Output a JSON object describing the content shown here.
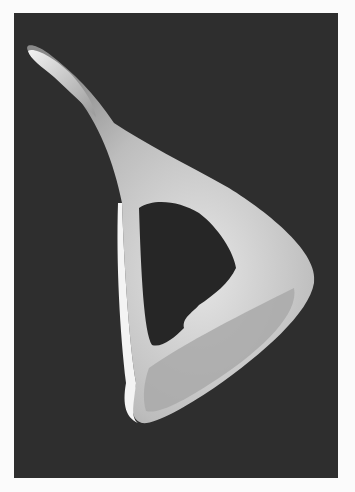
{
  "image": {
    "description": "Grayscale electron micrograph of a curved, triangular ossicle-like specimen with a large central opening, on dark background",
    "background_color": "#2e2e2e",
    "page_color": "#fbfbfb",
    "specimen_color": "#d8d8d8"
  }
}
